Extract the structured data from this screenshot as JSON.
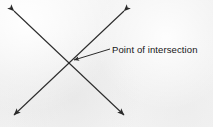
{
  "figure": {
    "alt_title": "Two straight lines crossing, with the crossing point labelled",
    "background_color": "#f3f3f3",
    "ink_color": "#2b2b2b",
    "text_color": "#161616",
    "width": 213,
    "height": 127,
    "annotation": {
      "text": "Point of intersection",
      "x": 112,
      "y": 44
    },
    "intersection": {
      "x": 69,
      "y": 62
    },
    "leader_line": {
      "from_x": 110,
      "from_y": 49,
      "to_x": 74,
      "to_y": 60
    },
    "lines": [
      {
        "name": "line-nw-se",
        "x1": 14,
        "y1": 11,
        "x2": 124,
        "y2": 115,
        "arrow_start": true,
        "arrow_end": true
      },
      {
        "name": "line-ne-sw",
        "x1": 124,
        "y1": 11,
        "x2": 14,
        "y2": 115,
        "arrow_start": true,
        "arrow_end": true
      }
    ],
    "arrow_tips": [
      {
        "name": "arrow-tip-top-left",
        "x": 14,
        "y": 11
      },
      {
        "name": "arrow-tip-top-right",
        "x": 124,
        "y": 11
      },
      {
        "name": "arrow-tip-bottom-left",
        "x": 14,
        "y": 115
      },
      {
        "name": "arrow-tip-bottom-right",
        "x": 124,
        "y": 115
      }
    ],
    "bleed_through_text": "faint show-through from reverse page"
  }
}
